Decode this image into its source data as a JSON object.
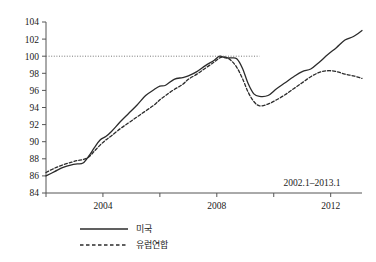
{
  "chart_data": {
    "type": "line",
    "title": "",
    "xlabel": "",
    "ylabel": "",
    "annotation": "2002.1–2013.1",
    "grid": false,
    "legend_position": "bottom",
    "ylim": [
      84,
      104
    ],
    "xlim": [
      2002.0,
      2013.1
    ],
    "ytick_labels": [
      "84",
      "86",
      "88",
      "90",
      "92",
      "94",
      "96",
      "98",
      "100",
      "102",
      "104"
    ],
    "ytick_values": [
      84,
      86,
      88,
      90,
      92,
      94,
      96,
      98,
      100,
      102,
      104
    ],
    "xtick_labels": [
      "2004",
      "2008",
      "2012"
    ],
    "xtick_values": [
      2004,
      2008,
      2012
    ],
    "reference_line": {
      "y": 100,
      "x_start": 2002.0,
      "x_end": 2009.5,
      "style": "dotted"
    },
    "x": [
      2002.0,
      2002.3,
      2002.6,
      2002.9,
      2003.1,
      2003.3,
      2003.5,
      2003.7,
      2003.9,
      2004.1,
      2004.3,
      2004.6,
      2004.9,
      2005.2,
      2005.5,
      2005.8,
      2006.0,
      2006.2,
      2006.5,
      2006.8,
      2007.0,
      2007.3,
      2007.6,
      2007.9,
      2008.1,
      2008.3,
      2008.5,
      2008.7,
      2008.9,
      2009.1,
      2009.3,
      2009.5,
      2009.8,
      2010.1,
      2010.4,
      2010.7,
      2011.0,
      2011.3,
      2011.6,
      2011.9,
      2012.2,
      2012.5,
      2012.8,
      2013.1
    ],
    "series": [
      {
        "name": "미국",
        "style": "solid",
        "values": [
          86.0,
          86.5,
          87.0,
          87.3,
          87.4,
          87.5,
          88.3,
          89.3,
          90.2,
          90.6,
          91.2,
          92.3,
          93.3,
          94.3,
          95.4,
          96.1,
          96.5,
          96.6,
          97.3,
          97.5,
          97.7,
          98.2,
          98.9,
          99.5,
          100.0,
          99.8,
          99.8,
          99.7,
          98.6,
          96.8,
          95.6,
          95.3,
          95.4,
          96.2,
          96.9,
          97.6,
          98.2,
          98.5,
          99.3,
          100.2,
          101.0,
          101.9,
          102.3,
          103.0
        ]
      },
      {
        "name": "유럽연합",
        "style": "dashed",
        "values": [
          86.4,
          86.9,
          87.3,
          87.6,
          87.8,
          87.9,
          88.2,
          88.9,
          89.6,
          90.2,
          90.7,
          91.5,
          92.2,
          92.9,
          93.6,
          94.3,
          94.9,
          95.4,
          96.1,
          96.7,
          97.3,
          97.9,
          98.6,
          99.3,
          99.8,
          99.9,
          99.5,
          98.7,
          97.4,
          95.8,
          94.7,
          94.2,
          94.4,
          94.9,
          95.5,
          96.2,
          96.9,
          97.6,
          98.1,
          98.3,
          98.2,
          97.9,
          97.7,
          97.4
        ]
      }
    ]
  },
  "legend": {
    "items": [
      {
        "label": "미국",
        "style": "solid"
      },
      {
        "label": "유럽연합",
        "style": "dashed"
      }
    ]
  }
}
